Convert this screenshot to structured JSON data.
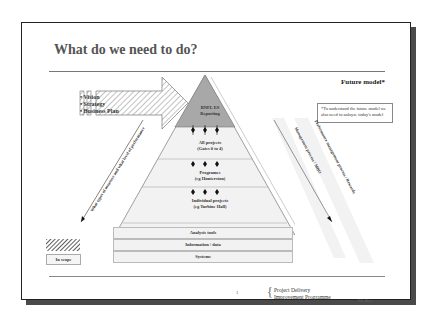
{
  "slide": {
    "title": "What do we need to do?",
    "future_model_label": "Future model*",
    "note": "*To understand the future model we also need to anlayse today's model"
  },
  "arrow": {
    "bullets": [
      "• Vision",
      "• Strategy",
      "• Business Plan"
    ]
  },
  "pyramid": {
    "apex": [
      "BNFL ES",
      "Reporting"
    ],
    "levels": [
      {
        "line1": "All projects",
        "line2": "(Gates 0 to 4)"
      },
      {
        "line1": "Programes",
        "line2": "(eg Hunterston)"
      },
      {
        "line1": "Individual projects",
        "line2": "(eg Turbine Hall)"
      }
    ],
    "foundation": [
      "Analysis tools",
      "Information / data",
      "Systems"
    ]
  },
  "diagonals": {
    "left": "What types of measure and what level of performance",
    "right_inner": "Management process / MBO",
    "right_outer": "Performance management process / Rewards"
  },
  "legend": {
    "in_scope": "In scope"
  },
  "footer": {
    "page_number": "1",
    "programme_line1": "Project Delivery",
    "programme_line2": "Improvement Programme",
    "file_ref": "File Ref"
  },
  "colors": {
    "apex_fill": "#a8a8a8",
    "pyramid_fill": "#efefef",
    "frame_shadow": "#4a4a4a",
    "title_text": "#555555"
  }
}
